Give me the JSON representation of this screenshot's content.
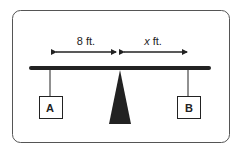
{
  "diagram": {
    "type": "seesaw-lever",
    "left_distance_label": "8 ft.",
    "right_distance_var": "x",
    "right_distance_unit": " ft.",
    "left_weight_label": "A",
    "right_weight_label": "B",
    "colors": {
      "stroke": "#222222",
      "frame": "#555555",
      "background": "#ffffff"
    }
  }
}
